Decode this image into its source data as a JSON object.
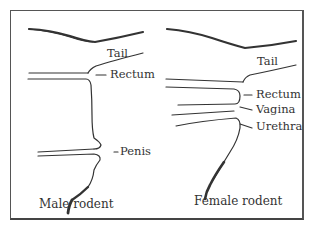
{
  "diagram": {
    "panels": [
      {
        "caption": "Male rodent",
        "labels": [
          "Tail",
          "Rectum",
          "Penis"
        ]
      },
      {
        "caption": "Female rodent",
        "labels": [
          "Tail",
          "Rectum",
          "Vagina",
          "Urethra"
        ]
      }
    ],
    "colors": {
      "line": "#333333",
      "border": "#555555",
      "background": "#ffffff"
    }
  }
}
